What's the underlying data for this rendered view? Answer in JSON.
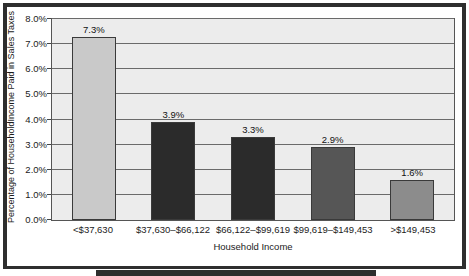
{
  "chart_data": {
    "type": "bar",
    "title": "",
    "xlabel": "Household Income",
    "ylabel": "Percentage of HouseholdIncome Paid in Sales Taxes",
    "categories": [
      "<$37,630",
      "$37,630–$66,122",
      "$66,122–$99,619",
      "$99,619–$149,453",
      ">$149,453"
    ],
    "values": [
      7.3,
      3.9,
      3.3,
      2.9,
      1.6
    ],
    "value_labels": [
      "7.3%",
      "3.9%",
      "3.3%",
      "2.9%",
      "1.6%"
    ],
    "bar_colors": [
      "#c9c9c9",
      "#2b2b2b",
      "#2b2b2b",
      "#565656",
      "#8c8c8c"
    ],
    "ylim": [
      0,
      8
    ],
    "ytick_values": [
      0.0,
      1.0,
      2.0,
      3.0,
      4.0,
      5.0,
      6.0,
      7.0,
      8.0
    ],
    "ytick_labels": [
      "0.0%",
      "1.0%",
      "2.0%",
      "3.0%",
      "4.0%",
      "5.0%",
      "6.0%",
      "7.0%",
      "8.0%"
    ],
    "grid": "horizontal",
    "legend": "none",
    "plot_background": "#ececec",
    "frame_color": "#2e2e2e",
    "axis_color": "#555555",
    "gridline_color": "#6a6a6a",
    "text_color": "#1b1b1b"
  }
}
